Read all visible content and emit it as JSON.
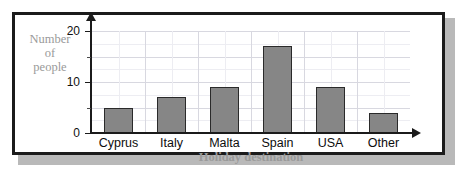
{
  "page": {
    "clipped_header_text": "",
    "frame_border_color": "#1b1b1b",
    "shadow_color": "#b9b9b9",
    "background": "#ffffff"
  },
  "chart_data": {
    "type": "bar",
    "title": "",
    "subtitle": "",
    "categories": [
      "Cyprus",
      "Italy",
      "Malta",
      "Spain",
      "USA",
      "Other"
    ],
    "values": [
      5,
      7,
      9,
      17,
      9,
      4
    ],
    "series": [
      {
        "name": "Number of people",
        "values": [
          5,
          7,
          9,
          17,
          9,
          4
        ]
      }
    ],
    "xlabel": "Holiday destination",
    "ylabel": "Number of people",
    "ylabel_lines": [
      "Number",
      "of",
      "people"
    ],
    "ylim": [
      0,
      20
    ],
    "ytick_labels": [
      "0",
      "10",
      "20"
    ],
    "ytick_values": [
      0,
      10,
      20
    ],
    "yminor_tick_values": [
      5,
      15
    ],
    "ytick_interval": 10,
    "grid": true,
    "grid_major_interval": 5,
    "legend": false,
    "legend_position": "none",
    "bar_color": "#868686",
    "bar_border_color": "#2a2a2a",
    "axis_color": "#1b1b1b",
    "grid_color": "#d8d8e0",
    "axis_title_color": "#9a9a9a",
    "tick_label_color": "#111111",
    "category_label_color": "#0d0d0d",
    "annotations": []
  }
}
